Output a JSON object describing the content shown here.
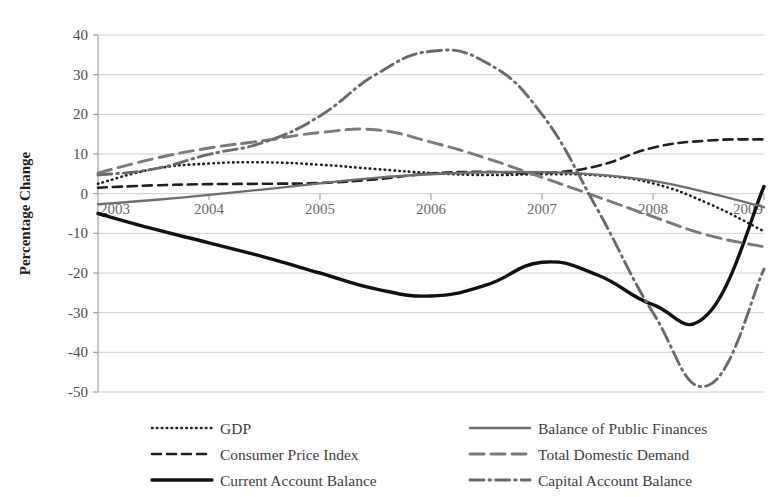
{
  "chart_data": {
    "type": "line",
    "title": "",
    "xlabel": "",
    "ylabel": "Percentage Change",
    "ylim": [
      -50,
      40
    ],
    "xlim": [
      2003,
      2009
    ],
    "grid": true,
    "legend_position": "bottom",
    "y_ticks": [
      "40",
      "30",
      "20",
      "10",
      "0",
      "-10",
      "-20",
      "-30",
      "-40",
      "-50"
    ],
    "y_tick_values": [
      40,
      30,
      20,
      10,
      0,
      -10,
      -20,
      -30,
      -40,
      -50
    ],
    "x_ticks": [
      "2003",
      "2004",
      "2005",
      "2006",
      "2007",
      "2008",
      "2009"
    ],
    "x_tick_values": [
      2003,
      2004,
      2005,
      2006,
      2007,
      2008,
      2009
    ],
    "x": [
      2003,
      2003.5,
      2004,
      2004.5,
      2005,
      2005.5,
      2006,
      2006.5,
      2007,
      2007.5,
      2008,
      2008.5,
      2009
    ],
    "series": [
      {
        "name": "GDP",
        "style": "dotted",
        "color": "#1f1f1f",
        "width": 2.6,
        "dash": "0.5,4.4",
        "values": [
          2.5,
          6.2,
          7.6,
          7.9,
          7.3,
          6.2,
          5.2,
          4.7,
          4.9,
          4.6,
          2.6,
          -2.5,
          -9.5
        ]
      },
      {
        "name": "Consumer Price Index",
        "style": "dashed",
        "color": "#1f1f1f",
        "width": 2.6,
        "dash": "9,6",
        "values": [
          1.5,
          2.1,
          2.4,
          2.5,
          2.7,
          3.6,
          5.1,
          5.5,
          5.2,
          7.0,
          11.6,
          13.4,
          13.7
        ]
      },
      {
        "name": "Current Account Balance",
        "style": "solid",
        "color": "#111111",
        "width": 3.4,
        "dash": "none",
        "values": [
          -5.0,
          -8.9,
          -12.4,
          -16.0,
          -20.0,
          -24.0,
          -25.8,
          -23.0,
          -17.3,
          -20.5,
          -28.0,
          -30.2,
          1.8
        ]
      },
      {
        "name": "Balance of Public Finances",
        "style": "solid",
        "color": "#6d6d6d",
        "width": 2.3,
        "dash": "none",
        "values": [
          -2.7,
          -1.6,
          -0.3,
          1.1,
          2.6,
          4.0,
          4.9,
          5.4,
          5.4,
          4.8,
          3.2,
          0.2,
          -3.4
        ]
      },
      {
        "name": "Total Domestic Demand",
        "style": "long-dash",
        "color": "#7a7a7a",
        "width": 2.9,
        "dash": "14,7",
        "values": [
          5.2,
          8.8,
          11.5,
          13.4,
          15.4,
          16.1,
          13.0,
          8.9,
          4.1,
          -0.8,
          -5.8,
          -10.5,
          -13.4
        ]
      },
      {
        "name": "Capital Account Balance",
        "style": "dash-dot",
        "color": "#6a6a6a",
        "width": 2.9,
        "dash": "14,5,1.6,5",
        "values": [
          4.7,
          6.2,
          9.9,
          13.0,
          19.6,
          30.0,
          35.9,
          33.0,
          20.0,
          -4.0,
          -30.0,
          -48.3,
          -19.0
        ]
      }
    ]
  },
  "legend": {
    "columns": [
      {
        "entries": [
          {
            "label": "GDP",
            "series": "GDP"
          },
          {
            "label": "Consumer Price Index",
            "series": "Consumer Price Index"
          },
          {
            "label": "Current Account Balance",
            "series": "Current Account Balance"
          }
        ]
      },
      {
        "entries": [
          {
            "label": "Balance of Public Finances",
            "series": "Balance of Public Finances"
          },
          {
            "label": "Total Domestic Demand",
            "series": "Total Domestic Demand"
          },
          {
            "label": "Capital Account Balance",
            "series": "Capital Account Balance"
          }
        ]
      }
    ]
  }
}
